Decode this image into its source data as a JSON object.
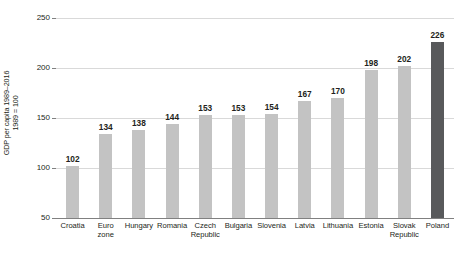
{
  "chart_data": {
    "type": "bar",
    "title": "",
    "subtitle": "",
    "xlabel": "",
    "ylabel_lines": [
      "GDP per capita 1989–2016",
      "1989 = 100"
    ],
    "ylim": [
      50,
      250
    ],
    "yticks": [
      50,
      100,
      150,
      200,
      250
    ],
    "ytick_labels": [
      "50",
      "100",
      "150",
      "200",
      "250"
    ],
    "grid": true,
    "legend": "none",
    "value_labels_shown": true,
    "categories": [
      "Croatia",
      "Euro zone",
      "Hungary",
      "Romania",
      "Czech Republic",
      "Bulgaria",
      "Slovenia",
      "Latvia",
      "Lithuania",
      "Estonia",
      "Slovak Republic",
      "Poland"
    ],
    "category_label_lines": [
      [
        "Croatia"
      ],
      [
        "Euro",
        "zone"
      ],
      [
        "Hungary"
      ],
      [
        "Romania"
      ],
      [
        "Czech",
        "Republic"
      ],
      [
        "Bulgaria"
      ],
      [
        "Slovenia"
      ],
      [
        "Latvia"
      ],
      [
        "Lithuania"
      ],
      [
        "Estonia"
      ],
      [
        "Slovak",
        "Republic"
      ],
      [
        "Poland"
      ]
    ],
    "values": [
      102,
      134,
      138,
      144,
      153,
      153,
      154,
      167,
      170,
      198,
      202,
      226
    ],
    "value_label_text": [
      "102",
      "134",
      "138",
      "144",
      "153",
      "153",
      "154",
      "167",
      "170",
      "198",
      "202",
      "226"
    ],
    "bar_colors": [
      "#c3c3c3",
      "#c3c3c3",
      "#c3c3c3",
      "#c3c3c3",
      "#c3c3c3",
      "#c3c3c3",
      "#c3c3c3",
      "#c3c3c3",
      "#c3c3c3",
      "#c3c3c3",
      "#c3c3c3",
      "#58595b"
    ],
    "highlight_category": "Poland",
    "colors": {
      "bar_default": "#c3c3c3",
      "bar_highlight": "#58595b",
      "gridline": "#d9d9d9",
      "axis": "#808080",
      "text": "#231f20",
      "background": "#ffffff"
    }
  }
}
